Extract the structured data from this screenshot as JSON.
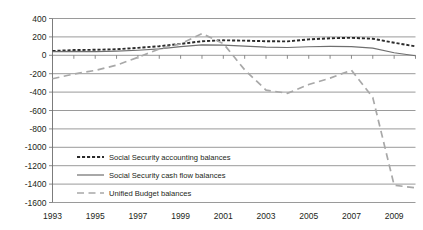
{
  "chart_data": {
    "type": "line",
    "title": "",
    "subtitle": "",
    "xlabel": "",
    "ylabel": "",
    "xlim": [
      1993,
      2010
    ],
    "ylim": [
      -1600,
      400
    ],
    "ytick_step": 200,
    "grid": true,
    "legend_position": "inside-lower-left",
    "ticks": {
      "y": [
        "400",
        "200",
        "0",
        "-200",
        "-400",
        "-600",
        "-800",
        "-1000",
        "-1200",
        "-1400",
        "-1600"
      ],
      "y_values": [
        400,
        200,
        0,
        -200,
        -400,
        -600,
        -800,
        -1000,
        -1200,
        -1400,
        -1600
      ],
      "x": [
        "1993",
        "1995",
        "1997",
        "1999",
        "2001",
        "2003",
        "2005",
        "2007",
        "2009"
      ],
      "x_values": [
        1993,
        1995,
        1997,
        1999,
        2001,
        2003,
        2005,
        2007,
        2009
      ],
      "x_minor_values": [
        1994,
        1996,
        1998,
        2000,
        2002,
        2004,
        2006,
        2008,
        2010
      ]
    },
    "x": [
      1993,
      1994,
      1995,
      1996,
      1997,
      1998,
      1999,
      2000,
      2001,
      2002,
      2003,
      2004,
      2005,
      2006,
      2007,
      2008,
      2009,
      2010
    ],
    "series": [
      {
        "name": "Social Security accounting balances",
        "style": "dotted-thick",
        "color": "#2b2b2b",
        "values": [
          47,
          57,
          60,
          66,
          81,
          99,
          124,
          153,
          163,
          159,
          153,
          151,
          173,
          185,
          190,
          180,
          137,
          97
        ]
      },
      {
        "name": "Social Security cash flow balances",
        "style": "solid-thin",
        "color": "#6f6f6f",
        "values": [
          39,
          43,
          39,
          45,
          55,
          70,
          94,
          113,
          110,
          100,
          89,
          85,
          93,
          96,
          94,
          78,
          28,
          -5
        ]
      },
      {
        "name": "Unified Budget balances",
        "style": "dashed-long",
        "color": "#a8a8a8",
        "values": [
          -255,
          -203,
          -164,
          -107,
          -22,
          69,
          126,
          236,
          128,
          -158,
          -378,
          -413,
          -318,
          -248,
          -161,
          -459,
          -1413,
          -1440
        ]
      }
    ],
    "legend": [
      {
        "label": "Social Security accounting balances",
        "style": "dotted-thick"
      },
      {
        "label": "Social Security cash flow balances",
        "style": "solid-thin"
      },
      {
        "label": "Unified Budget balances",
        "style": "dashed-long"
      }
    ]
  }
}
